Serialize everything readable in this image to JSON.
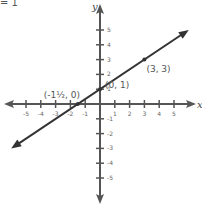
{
  "header": {
    "equation_fragment": "= 1"
  },
  "chart_data": {
    "type": "line",
    "title": "",
    "xlabel": "x",
    "ylabel": "y",
    "xlim": [
      -5,
      5
    ],
    "ylim": [
      -5,
      5
    ],
    "grid": false,
    "x_ticks": [
      -5,
      -4,
      -3,
      -2,
      -1,
      1,
      2,
      3,
      4,
      5
    ],
    "y_ticks": [
      -5,
      -4,
      -3,
      -2,
      -1,
      1,
      2,
      3,
      4,
      5
    ],
    "series": [
      {
        "name": "line",
        "slope": 0.6667,
        "intercept": 1,
        "points": [
          [
            -1.5,
            0
          ],
          [
            0,
            1
          ],
          [
            3,
            3
          ]
        ]
      }
    ],
    "annotations": [
      {
        "label": "(-1½, 0)",
        "x": -1.5,
        "y": 0
      },
      {
        "label": "(0, 1)",
        "x": 0,
        "y": 1
      },
      {
        "label": "(3, 3)",
        "x": 3,
        "y": 3
      }
    ],
    "colors": {
      "axis": "#555555",
      "line": "#333333",
      "text": "#555555"
    }
  }
}
